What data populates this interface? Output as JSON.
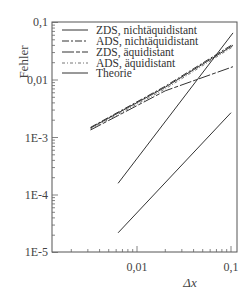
{
  "chart_data": {
    "type": "line",
    "title": "",
    "xlabel": "Δx",
    "ylabel": "Fehler",
    "xscale": "log",
    "yscale": "log",
    "xlim": [
      0.00125,
      0.115
    ],
    "ylim": [
      1e-05,
      0.1
    ],
    "x_ticks": [
      "0,01",
      "0,1"
    ],
    "y_ticks": [
      "0,1",
      "0,01",
      "1E-3",
      "1E-4",
      "1E-5"
    ],
    "grid": false,
    "legend_position": "upper-left",
    "series": [
      {
        "name": "ZDS, nichtäquidistant",
        "style": "solid",
        "x": [
          0.0032,
          0.02,
          0.105
        ],
        "y": [
          0.00146,
          0.0075,
          0.04
        ]
      },
      {
        "name": "ADS, nichtäquidistant",
        "style": "dashdot",
        "x": [
          0.0032,
          0.02,
          0.105
        ],
        "y": [
          0.0015,
          0.0078,
          0.042
        ]
      },
      {
        "name": "ZDS, äquidistant",
        "style": "dashed",
        "x": [
          0.0032,
          0.02,
          0.105
        ],
        "y": [
          0.00135,
          0.0065,
          0.017
        ]
      },
      {
        "name": "ADS, äquidistant",
        "style": "dashdotdot",
        "x": [
          0.0032,
          0.02,
          0.105
        ],
        "y": [
          0.0014,
          0.007,
          0.038
        ]
      },
      {
        "name": "Theorie",
        "style": "solid",
        "x": [
          0.0063,
          0.105
        ],
        "y": [
          0.00016,
          0.066
        ]
      },
      {
        "name": "Theorie",
        "style": "solid",
        "x": [
          0.0063,
          0.1
        ],
        "y": [
          2.2e-05,
          0.0027
        ]
      }
    ]
  },
  "axes": {
    "ylabel": "Fehler",
    "xlabel": "Δx",
    "y_tick_labels": [
      "0,1",
      "0,01",
      "1E-3",
      "1E-4",
      "1E-5"
    ],
    "x_tick_labels": [
      "0,01",
      "0,1"
    ]
  },
  "legend": {
    "items": [
      "ZDS, nichtäquidistant",
      "ADS, nichtäquidistant",
      "ZDS, äquidistant",
      "ADS, äquidistant",
      "Theorie"
    ]
  },
  "colors": {
    "line": "#333333",
    "axis": "#555555"
  }
}
